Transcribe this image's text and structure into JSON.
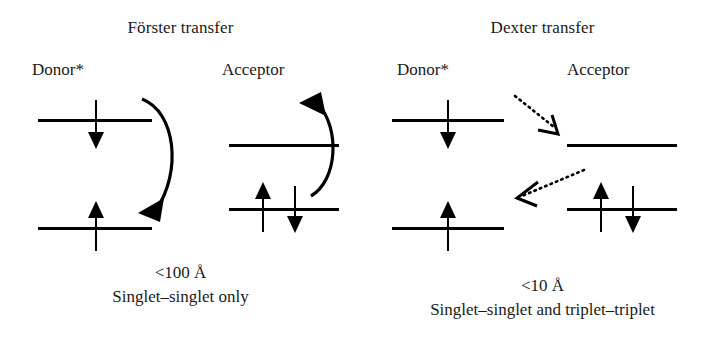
{
  "figure": {
    "kind": "energy-level-diagram"
  },
  "panels": [
    {
      "id": "forster",
      "title": "Förster transfer",
      "donor_label": "Donor*",
      "acceptor_label": "Acceptor",
      "arrow_style": "solid-curved",
      "caption_distance": "<100 Å",
      "caption_rule": "Singlet–singlet only",
      "donor": {
        "upper_level_electrons": [
          "down"
        ],
        "lower_level_electrons": [
          "up"
        ]
      },
      "acceptor": {
        "upper_level_electrons": [],
        "lower_level_electrons": [
          "up",
          "down"
        ]
      }
    },
    {
      "id": "dexter",
      "title": "Dexter transfer",
      "donor_label": "Donor*",
      "acceptor_label": "Acceptor",
      "arrow_style": "dotted-straight",
      "caption_distance": "<10 Å",
      "caption_rule": "Singlet–singlet and triplet–triplet",
      "donor": {
        "upper_level_electrons": [
          "down"
        ],
        "lower_level_electrons": [
          "up"
        ]
      },
      "acceptor": {
        "upper_level_electrons": [],
        "lower_level_electrons": [
          "up",
          "down"
        ]
      }
    }
  ],
  "colors": {
    "ink": "#000000",
    "background": "#ffffff",
    "text": "#1a1a1a"
  }
}
